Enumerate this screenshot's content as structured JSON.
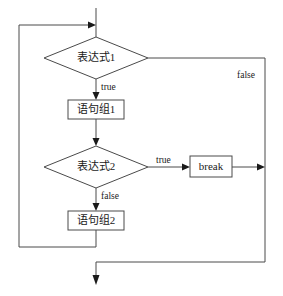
{
  "diagram": {
    "background_color": "#ffffff",
    "line_color": "#4a4a4a",
    "text_color": "#1a1a1a",
    "nodes": [
      {
        "id": "decision1",
        "type": "decision",
        "label": "表达式1",
        "cx": 96,
        "cy": 58,
        "rx": 52,
        "ry": 21
      },
      {
        "id": "process1",
        "type": "process",
        "label": "语句组1",
        "x": 68,
        "y": 100,
        "w": 56,
        "h": 19
      },
      {
        "id": "decision2",
        "type": "decision",
        "label": "表达式2",
        "cx": 96,
        "cy": 167,
        "rx": 52,
        "ry": 21
      },
      {
        "id": "breakbox",
        "type": "process",
        "label": "break",
        "x": 190,
        "y": 156,
        "w": 42,
        "h": 21
      },
      {
        "id": "process2",
        "type": "process",
        "label": "语句组2",
        "x": 68,
        "y": 211,
        "w": 56,
        "h": 19
      }
    ],
    "edge_labels": [
      {
        "id": "label-true-1",
        "text": "true",
        "x": 101,
        "y": 88
      },
      {
        "id": "label-false-1",
        "text": "false",
        "x": 237,
        "y": 76
      },
      {
        "id": "label-true-2",
        "text": "true",
        "x": 156,
        "y": 161
      },
      {
        "id": "label-false-2",
        "text": "false",
        "x": 101,
        "y": 197
      }
    ]
  }
}
